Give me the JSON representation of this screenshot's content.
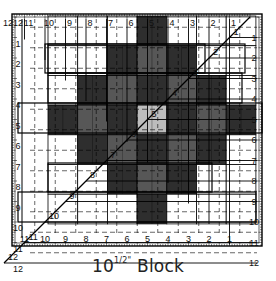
{
  "caption": {
    "size_whole": "10",
    "size_fraction": "1/2\"",
    "word": "Block"
  },
  "colors": {
    "paper": "#ffffff",
    "ink": "#111111",
    "fabric_dark": "#2e2e2e",
    "fabric_mid": "#575757",
    "fabric_light": "#bdbdbd",
    "fabric_white": "#ffffff"
  },
  "ruler": {
    "unit": "inch",
    "top_scale_labels": [
      "12",
      "11",
      "10",
      "9",
      "8",
      "7",
      "6",
      "5",
      "4",
      "3",
      "2",
      "1"
    ],
    "left_scale_labels": [
      "12",
      "1",
      "2",
      "3",
      "4",
      "5",
      "6",
      "7",
      "8",
      "9",
      "10",
      "11",
      "12"
    ],
    "bottom_scale_labels": [
      "11",
      "10",
      "9",
      "8",
      "7",
      "6",
      "5",
      "4",
      "3",
      "2",
      "1"
    ],
    "right_scale_labels": [
      "1",
      "2",
      "3",
      "4",
      "5",
      "6",
      "7",
      "8",
      "9",
      "10",
      "11",
      "12"
    ],
    "diagonal_labels": [
      "1",
      "2",
      "3",
      "4",
      "5",
      "6",
      "7",
      "8",
      "9",
      "10",
      "11",
      "12"
    ]
  },
  "block": {
    "finished_size_in": 10.5,
    "grid_cols": 7,
    "grid_rows": 7,
    "cells": [
      [
        "w",
        "w",
        "w",
        "d",
        "w",
        "w",
        "w"
      ],
      [
        "w",
        "w",
        "d",
        "m",
        "d",
        "w",
        "w"
      ],
      [
        "w",
        "d",
        "m",
        "d",
        "m",
        "d",
        "w"
      ],
      [
        "d",
        "m",
        "d",
        "l",
        "d",
        "m",
        "d"
      ],
      [
        "w",
        "d",
        "m",
        "d",
        "m",
        "d",
        "w"
      ],
      [
        "w",
        "w",
        "d",
        "m",
        "d",
        "w",
        "w"
      ],
      [
        "w",
        "w",
        "w",
        "d",
        "w",
        "w",
        "w"
      ]
    ]
  }
}
